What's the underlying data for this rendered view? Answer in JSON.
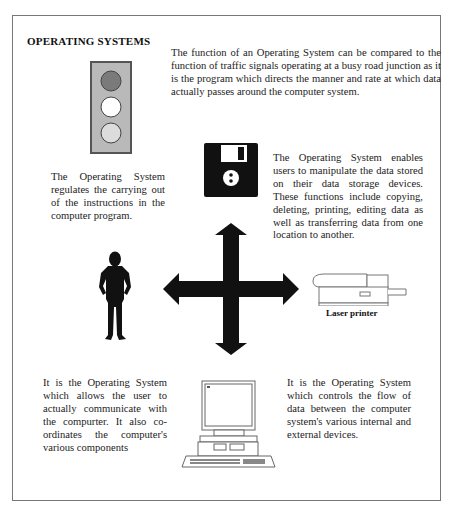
{
  "heading": "OPERATING SYSTEMS",
  "paragraphs": {
    "traffic_signals": "The function of an Operating System can be compared to the function of traffic signals operating at a busy road junction as it is the program which directs the manner and rate at which data actually passes around the computer system.",
    "instructions": "The Operating System regulates the carrying out of the instructions in the computer program.",
    "storage": "The Operating System enables users to manipulate the data stored on their data storage devices. These functions include copying, deleting, printing, editing data as well as transferring data from one location to another.",
    "user_communication": "It is the Operating System which allows the user to actually communicate with the compurter. It also co-ordinates the computer's various components",
    "data_flow": "It is the Operating System which controls the flow of data between the computer system's various internal and external devices."
  },
  "captions": {
    "printer": "Laser printer"
  },
  "illustrations": {
    "traffic_light": {
      "frame_color": "#b9b9b9",
      "border_color": "#555555",
      "lights": [
        "#7a7a7a",
        "#ffffff",
        "#dcdcdc"
      ]
    },
    "floppy_disk": "floppy-disk-icon",
    "four_way_arrow": "four-way-arrow-icon",
    "person": "person-silhouette-icon",
    "printer": "laser-printer-icon",
    "computer": "desktop-computer-icon"
  }
}
